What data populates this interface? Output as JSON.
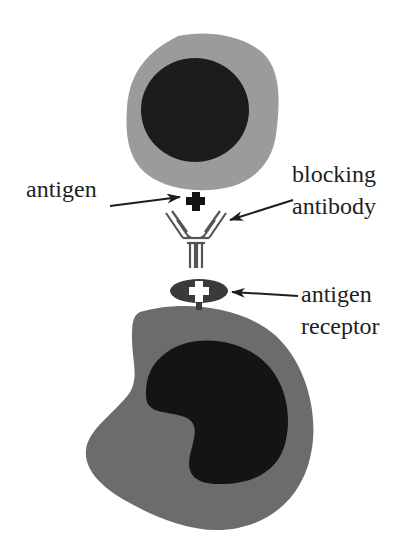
{
  "diagram": {
    "title": "",
    "colors": {
      "background": "#ffffff",
      "top_cell_cytoplasm": "#9b9b9b",
      "top_cell_nucleus": "#1c1c1c",
      "bottom_cell_cytoplasm": "#6c6c6c",
      "bottom_cell_nucleus": "#141414",
      "antigen": "#141414",
      "antibody_stroke": "#555555",
      "receptor": "#3a3a3a",
      "arrow": "#1e1e1e",
      "text": "#1e1e1e"
    },
    "labels": {
      "antigen": "antigen",
      "blocking_antibody_line1": "blocking",
      "blocking_antibody_line2": "antibody",
      "antigen_receptor_line1": "antigen",
      "antigen_receptor_line2": "receptor"
    },
    "elements": [
      {
        "id": "top-cell",
        "description": "antigen-presenting cell with round nucleus"
      },
      {
        "id": "antigen",
        "description": "cross-shaped antigen on top cell"
      },
      {
        "id": "blocking-antibody",
        "description": "Y-shaped antibody"
      },
      {
        "id": "antigen-receptor",
        "description": "oval receptor with cross-shaped binding site"
      },
      {
        "id": "bottom-cell",
        "description": "lymphocyte with kidney-shaped nucleus"
      }
    ]
  }
}
